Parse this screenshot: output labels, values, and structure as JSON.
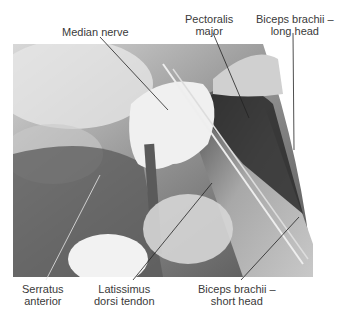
{
  "figure": {
    "photo_description": "Grayscale cadaveric dissection of the axilla with a gloved hand retracting tissue",
    "labels": {
      "median_nerve": "Median nerve",
      "pectoralis_major_l1": "Pectoralis",
      "pectoralis_major_l2": "major",
      "biceps_long_l1": "Biceps brachii –",
      "biceps_long_l2": "long head",
      "serratus_l1": "Serratus",
      "serratus_l2": "anterior",
      "latissimus_l1": "Latissimus",
      "latissimus_l2": "dorsi tendon",
      "biceps_short_l1": "Biceps brachii –",
      "biceps_short_l2": "short head"
    },
    "colors": {
      "background": "#ffffff",
      "text": "#3a3a3a",
      "leader_top": "#222222",
      "leader_bottom_on_photo": "#e8e8e8"
    }
  }
}
